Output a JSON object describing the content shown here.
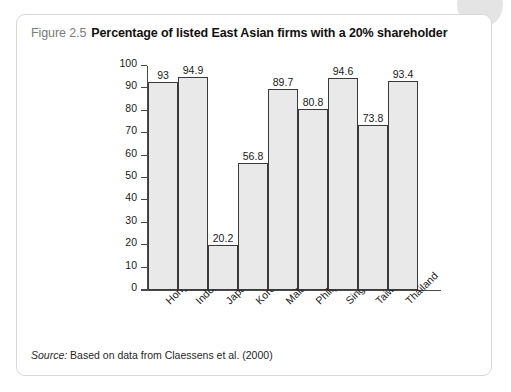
{
  "figure": {
    "number": "Figure 2.5",
    "title": "Percentage of listed East Asian firms with a 20% shareholder",
    "source_label": "Source:",
    "source_text": "Based on data from Claessens et al. (2000)"
  },
  "colors": {
    "panel_border": "#d8d8d8",
    "bar_fill": "#e9e9e9",
    "bar_stroke": "#3a3a3a",
    "axis": "#4a4a4a",
    "figure_number": "#7b7b7b",
    "title_text": "#111111"
  },
  "chart_data": {
    "type": "bar",
    "title": "Percentage of listed East Asian firms with a 20% shareholder",
    "xlabel": "",
    "ylabel": "",
    "ylim": [
      0,
      100
    ],
    "ytick_step": 10,
    "yticks": [
      100,
      90,
      80,
      70,
      60,
      50,
      40,
      30,
      20,
      10,
      0
    ],
    "grid": false,
    "legend": false,
    "categories": [
      "Hong Kong",
      "Indonesia",
      "Japan",
      "Korea",
      "Malaysia",
      "Philippines",
      "Singapore",
      "Taiwan",
      "Thailand"
    ],
    "values": [
      93,
      94.9,
      20.2,
      56.8,
      89.7,
      80.8,
      94.6,
      73.8,
      93.4
    ],
    "value_labels": [
      "93",
      "94.9",
      "20.2",
      "56.8",
      "89.7",
      "80.8",
      "94.6",
      "73.8",
      "93.4"
    ]
  }
}
